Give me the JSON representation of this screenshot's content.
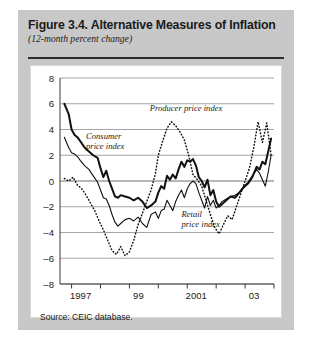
{
  "figure": {
    "title": "Figure 3.4. Alternative Measures of Inflation",
    "subtitle": "(12-month percent change)",
    "source": "Source: CEIC database."
  },
  "chart_data": {
    "type": "line",
    "title": "Figure 3.4. Alternative Measures of Inflation",
    "subtitle": "(12-month percent change)",
    "xlabel": "",
    "ylabel": "",
    "xlim": [
      1996.6,
      2004.0
    ],
    "ylim": [
      -8,
      8
    ],
    "yticks": [
      8,
      6,
      4,
      2,
      0,
      -2,
      -4,
      -6,
      -8
    ],
    "ytick_labels": [
      "8",
      "6",
      "4",
      "2",
      "0",
      "-2",
      "-4",
      "-6",
      "-8"
    ],
    "xticks": [
      1997,
      1998,
      1999,
      2000,
      2001,
      2002,
      2003,
      2004
    ],
    "xtick_labels": [
      "1997",
      "",
      "99",
      "",
      "2001",
      "",
      "03",
      ""
    ],
    "grid": "horizontal",
    "legend": "inline-annotations",
    "annotations": [
      {
        "text": "Consumer price index",
        "x": 1997.5,
        "y": 3.3,
        "series": "consumer"
      },
      {
        "text": "Producer price index",
        "x": 1999.7,
        "y": 5.4,
        "series": "producer"
      },
      {
        "text": "Retail price index",
        "x": 2000.8,
        "y": -2.8,
        "series": "retail"
      }
    ],
    "series": [
      {
        "name": "Consumer price index",
        "style": "solid-thick",
        "color": "#111111",
        "x": [
          1996.75,
          1996.9,
          1997.0,
          1997.1,
          1997.2,
          1997.3,
          1997.45,
          1997.6,
          1997.75,
          1997.9,
          1998.0,
          1998.1,
          1998.2,
          1998.3,
          1998.4,
          1998.5,
          1998.6,
          1998.7,
          1998.85,
          1999.0,
          1999.15,
          1999.3,
          1999.45,
          1999.6,
          1999.75,
          1999.9,
          2000.0,
          2000.1,
          2000.2,
          2000.3,
          2000.4,
          2000.5,
          2000.6,
          2000.7,
          2000.8,
          2000.9,
          2001.0,
          2001.1,
          2001.2,
          2001.3,
          2001.4,
          2001.5,
          2001.6,
          2001.7,
          2001.8,
          2001.9,
          2002.0,
          2002.1,
          2002.2,
          2002.35,
          2002.5,
          2002.65,
          2002.8,
          2002.95,
          2003.1,
          2003.25,
          2003.4,
          2003.5,
          2003.6,
          2003.7,
          2003.8,
          2003.9
        ],
        "y": [
          6.0,
          5.2,
          4.0,
          3.6,
          3.4,
          3.1,
          2.6,
          2.3,
          2.0,
          1.8,
          1.0,
          0.3,
          0.8,
          0.0,
          -0.6,
          -1.2,
          -1.3,
          -1.1,
          -1.2,
          -1.3,
          -1.5,
          -1.3,
          -1.6,
          -2.1,
          -1.9,
          -1.6,
          -0.9,
          -0.4,
          -0.6,
          0.4,
          0.1,
          0.5,
          0.2,
          0.9,
          1.5,
          1.1,
          1.6,
          1.5,
          1.7,
          1.2,
          0.3,
          0.0,
          -0.5,
          0.1,
          -1.1,
          -0.7,
          -1.6,
          -2.0,
          -1.8,
          -1.5,
          -1.2,
          -1.3,
          -0.9,
          -0.5,
          -0.2,
          0.3,
          1.1,
          0.9,
          1.5,
          1.3,
          2.3,
          3.3
        ]
      },
      {
        "name": "Retail price index",
        "style": "solid-thin",
        "color": "#111111",
        "x": [
          1996.75,
          1996.9,
          1997.0,
          1997.1,
          1997.2,
          1997.3,
          1997.45,
          1997.6,
          1997.75,
          1997.9,
          1998.0,
          1998.1,
          1998.2,
          1998.3,
          1998.4,
          1998.5,
          1998.6,
          1998.7,
          1998.85,
          1999.0,
          1999.15,
          1999.3,
          1999.45,
          1999.6,
          1999.75,
          1999.9,
          2000.0,
          2000.1,
          2000.2,
          2000.3,
          2000.4,
          2000.5,
          2000.6,
          2000.7,
          2000.8,
          2000.9,
          2001.0,
          2001.1,
          2001.2,
          2001.3,
          2001.4,
          2001.5,
          2001.6,
          2001.7,
          2001.8,
          2001.9,
          2002.0,
          2002.1,
          2002.2,
          2002.35,
          2002.5,
          2002.65,
          2002.8,
          2002.95,
          2003.1,
          2003.25,
          2003.4,
          2003.5,
          2003.6,
          2003.7,
          2003.8,
          2003.9
        ],
        "y": [
          3.4,
          2.6,
          2.2,
          2.1,
          1.9,
          1.6,
          1.2,
          0.9,
          0.4,
          -0.1,
          -0.7,
          -1.3,
          -1.4,
          -1.9,
          -2.6,
          -3.2,
          -3.5,
          -3.3,
          -3.0,
          -2.9,
          -3.1,
          -2.8,
          -3.3,
          -3.6,
          -2.6,
          -2.4,
          -2.9,
          -2.3,
          -2.2,
          -1.5,
          -1.9,
          -2.3,
          -1.6,
          -1.1,
          -0.7,
          -1.3,
          -0.6,
          -0.2,
          0.0,
          -0.2,
          -0.9,
          -1.5,
          -2.1,
          -1.2,
          -1.9,
          -1.5,
          -2.1,
          -1.9,
          -1.6,
          -1.4,
          -1.2,
          -1.1,
          -0.9,
          -0.4,
          -0.1,
          0.4,
          0.9,
          0.6,
          0.1,
          -0.4,
          0.7,
          2.0
        ]
      },
      {
        "name": "Producer price index",
        "style": "dotted",
        "color": "#111111",
        "x": [
          1996.75,
          1996.9,
          1997.05,
          1997.2,
          1997.35,
          1997.5,
          1997.65,
          1997.8,
          1997.95,
          1998.1,
          1998.25,
          1998.4,
          1998.55,
          1998.7,
          1998.85,
          1999.0,
          1999.15,
          1999.3,
          1999.45,
          1999.6,
          1999.75,
          1999.9,
          2000.0,
          2000.15,
          2000.3,
          2000.45,
          2000.6,
          2000.75,
          2000.9,
          2001.05,
          2001.2,
          2001.35,
          2001.5,
          2001.65,
          2001.8,
          2001.95,
          2002.1,
          2002.25,
          2002.4,
          2002.55,
          2002.7,
          2002.85,
          2003.0,
          2003.15,
          2003.3,
          2003.45,
          2003.6,
          2003.75,
          2003.9
        ],
        "y": [
          0.2,
          0.0,
          0.3,
          -0.3,
          -0.6,
          -1.1,
          -1.7,
          -2.3,
          -3.1,
          -3.8,
          -4.6,
          -5.4,
          -5.7,
          -5.1,
          -5.8,
          -5.5,
          -4.6,
          -3.4,
          -2.5,
          -1.6,
          -0.7,
          0.6,
          2.0,
          3.1,
          4.1,
          4.6,
          4.3,
          3.8,
          3.2,
          2.0,
          0.5,
          0.1,
          -0.4,
          -1.5,
          -2.6,
          -3.6,
          -4.1,
          -3.4,
          -2.7,
          -3.0,
          -2.0,
          -1.0,
          0.0,
          1.0,
          2.6,
          4.6,
          3.0,
          4.5,
          2.0
        ]
      }
    ]
  }
}
